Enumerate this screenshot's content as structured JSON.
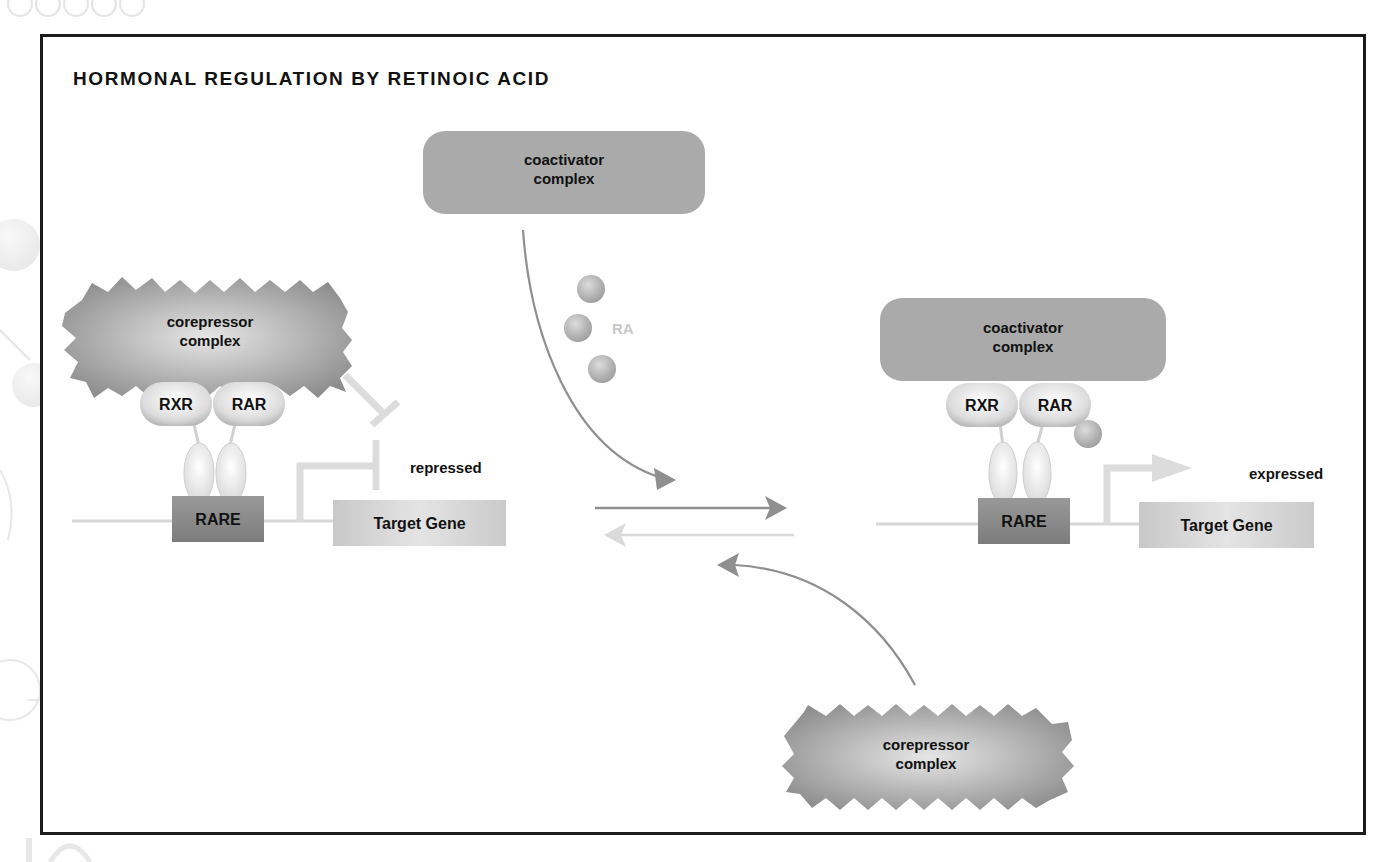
{
  "title": "HORMONAL REGULATION BY RETINOIC ACID",
  "colors": {
    "frame": "#1c1c1c",
    "complex_gray": "#a8a8a8",
    "rare_box": "#8a8a8a",
    "target_gene_box": "#cfcfcf",
    "dna_line": "#d8d8d8",
    "arrow_dark": "#8f8f8f",
    "arrow_light": "#d9d9d9",
    "ra_label": "#c8c8c8"
  },
  "left_state": {
    "corepressor": {
      "line1": "corepressor",
      "line2": "complex"
    },
    "receptor_left": "RXR",
    "receptor_right": "RAR",
    "response_element": "RARE",
    "gene": "Target Gene",
    "status": "repressed"
  },
  "center": {
    "coactivator": {
      "line1": "coactivator",
      "line2": "complex"
    },
    "ligand_label": "RA",
    "corepressor": {
      "line1": "corepressor",
      "line2": "complex"
    }
  },
  "right_state": {
    "coactivator": {
      "line1": "coactivator",
      "line2": "complex"
    },
    "receptor_left": "RXR",
    "receptor_right": "RAR",
    "response_element": "RARE",
    "gene": "Target Gene",
    "status": "expressed"
  }
}
